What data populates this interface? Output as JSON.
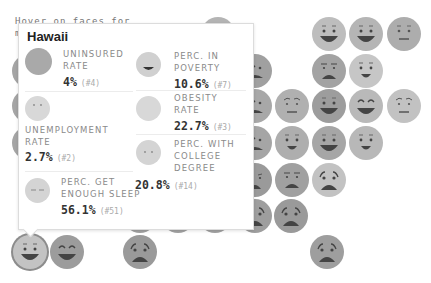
{
  "page": {
    "intro_text_line1": "Hover on faces for",
    "intro_text_line2": "m"
  },
  "tooltip": {
    "title": "Hawaii",
    "metrics": [
      {
        "label_line1": "UNINSURED",
        "label_line2": "RATE",
        "label_line3": "",
        "value": "4%",
        "rank": "(#4)",
        "face": "neutral-blank",
        "shade": "#a9a9a9"
      },
      {
        "label_line1": "PERC. IN",
        "label_line2": "POVERTY",
        "label_line3": "",
        "value": "10.6%",
        "rank": "(#7)",
        "face": "grin-mouth",
        "shade": "#d0d0d0"
      },
      {
        "label_line1": "UNEMPLOYMENT",
        "label_line2": "RATE",
        "label_line3": "",
        "value": "2.7%",
        "rank": "(#2)",
        "face": "dot-eyes",
        "shade": "#d8d8d8"
      },
      {
        "label_line1": "OBESITY",
        "label_line2": "RATE",
        "label_line3": "",
        "value": "22.7%",
        "rank": "(#3)",
        "face": "neutral-blank",
        "shade": "#d8d8d8"
      },
      {
        "label_line1": "PERC. WITH",
        "label_line2": "COLLEGE",
        "label_line3": "DEGREE",
        "value": "20.8%",
        "rank": "(#14)",
        "face": "dot-eyes",
        "shade": "#d4d4d4"
      },
      {
        "label_line1": "PERC. GET",
        "label_line2": "ENOUGH SLEEP",
        "label_line3": "",
        "value": "56.1%",
        "rank": "(#51)",
        "face": "sleepy-eyes",
        "shade": "#d4d4d4"
      }
    ]
  },
  "faces": [
    {
      "x": 201,
      "y": 17,
      "expr": "happy",
      "shade": "#b4b4b4"
    },
    {
      "x": 312,
      "y": 17,
      "expr": "happy",
      "shade": "#bdbdbd"
    },
    {
      "x": 349,
      "y": 17,
      "expr": "happy",
      "shade": "#b5b5b5"
    },
    {
      "x": 387,
      "y": 17,
      "expr": "neutral",
      "shade": "#adadad"
    },
    {
      "x": 12,
      "y": 54,
      "expr": "happy",
      "shade": "#a5a5a5"
    },
    {
      "x": 238,
      "y": 54,
      "expr": "shocked",
      "shade": "#a0a0a0"
    },
    {
      "x": 312,
      "y": 54,
      "expr": "grimace",
      "shade": "#a3a3a3"
    },
    {
      "x": 349,
      "y": 54,
      "expr": "smile",
      "shade": "#c6c6c6"
    },
    {
      "x": 12,
      "y": 89,
      "expr": "happy",
      "shade": "#a5a5a5"
    },
    {
      "x": 238,
      "y": 89,
      "expr": "shocked",
      "shade": "#a8a8a8"
    },
    {
      "x": 275,
      "y": 89,
      "expr": "worried",
      "shade": "#b0b0b0"
    },
    {
      "x": 312,
      "y": 89,
      "expr": "happy",
      "shade": "#9d9d9d"
    },
    {
      "x": 349,
      "y": 89,
      "expr": "happy-brow",
      "shade": "#b9b9b9"
    },
    {
      "x": 387,
      "y": 89,
      "expr": "worried",
      "shade": "#c2c2c2"
    },
    {
      "x": 12,
      "y": 126,
      "expr": "happy",
      "shade": "#a5a5a5"
    },
    {
      "x": 238,
      "y": 126,
      "expr": "shocked",
      "shade": "#a5a5a5"
    },
    {
      "x": 275,
      "y": 126,
      "expr": "smile",
      "shade": "#aeaeae"
    },
    {
      "x": 312,
      "y": 126,
      "expr": "happy",
      "shade": "#a6a6a6"
    },
    {
      "x": 349,
      "y": 126,
      "expr": "smile",
      "shade": "#b8b8b8"
    },
    {
      "x": 238,
      "y": 163,
      "expr": "sad",
      "shade": "#9a9a9a"
    },
    {
      "x": 275,
      "y": 163,
      "expr": "grimace",
      "shade": "#a0a0a0"
    },
    {
      "x": 312,
      "y": 163,
      "expr": "scared",
      "shade": "#c2c2c2"
    },
    {
      "x": 123,
      "y": 199,
      "expr": "sad",
      "shade": "#a2a2a2"
    },
    {
      "x": 161,
      "y": 199,
      "expr": "sad",
      "shade": "#a2a2a2"
    },
    {
      "x": 198,
      "y": 199,
      "expr": "sad",
      "shade": "#a2a2a2"
    },
    {
      "x": 238,
      "y": 199,
      "expr": "scared",
      "shade": "#9e9e9e"
    },
    {
      "x": 274,
      "y": 199,
      "expr": "scared",
      "shade": "#9a9a9a"
    },
    {
      "x": 13,
      "y": 235,
      "expr": "happy",
      "shade": "#c3c3c3",
      "selected": true
    },
    {
      "x": 50,
      "y": 235,
      "expr": "happy-brow",
      "shade": "#9c9c9c"
    },
    {
      "x": 123,
      "y": 235,
      "expr": "scared",
      "shade": "#9a9a9a"
    },
    {
      "x": 310,
      "y": 235,
      "expr": "scared",
      "shade": "#9e9e9e"
    }
  ]
}
